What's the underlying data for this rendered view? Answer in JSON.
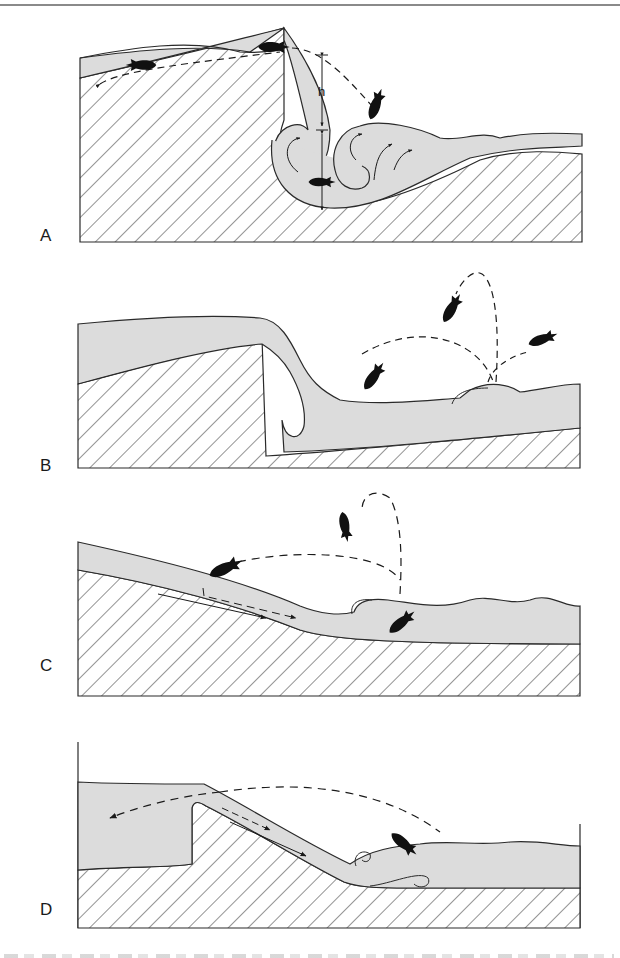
{
  "figure": {
    "panels": [
      {
        "id": "A",
        "label": "A",
        "description": "Plunging flow over a vertical drop with recirculating roller eddies; fish leaps height h from plunge pool",
        "annotation": "h"
      },
      {
        "id": "B",
        "label": "B",
        "description": "Nappe flow over a crest into pool; fish leap from standing wave downstream"
      },
      {
        "id": "C",
        "label": "C",
        "description": "Sloping chute flow with hydraulic jump; fish swims upstream and leaps"
      },
      {
        "id": "D",
        "label": "D",
        "description": "Weir with inclined chute into turbulent pool; fish leaps from jump area"
      }
    ],
    "colors": {
      "water": "#dcdcdc",
      "outline": "#2a2a2a",
      "hatch": "#3a3a3a",
      "fish": "#111111",
      "background": "#ffffff"
    },
    "caption": {
      "text": "",
      "visible": "truncated"
    }
  }
}
